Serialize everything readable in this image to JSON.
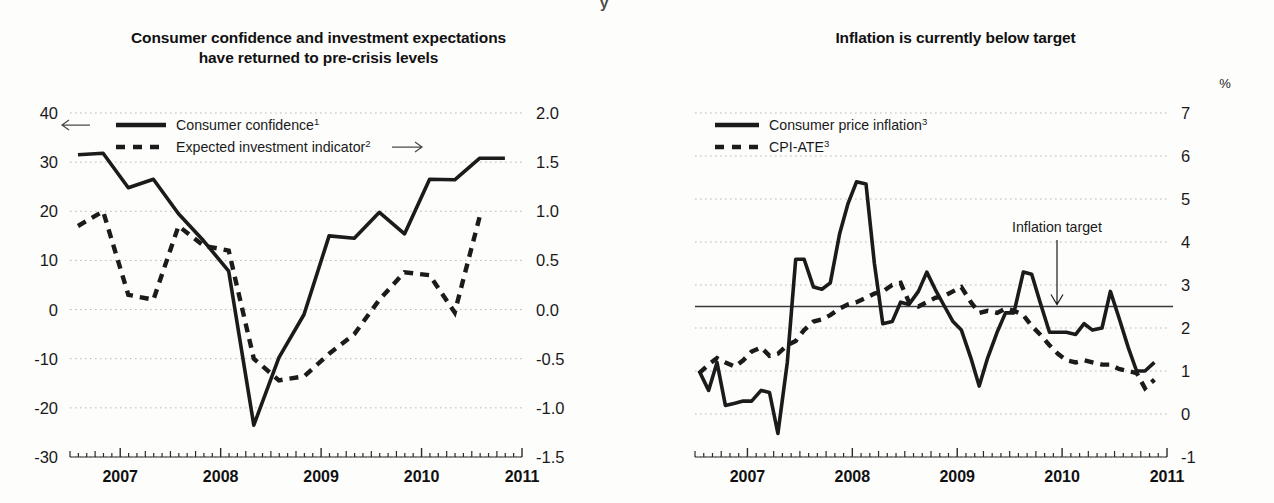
{
  "page": {
    "background": "#fdfdfc",
    "ink": "#1b1b1b",
    "grid_color": "#b9b9b9",
    "clipped_header_fragment": "y"
  },
  "left_panel": {
    "title": "Consumer confidence and investment expectations\nhave returned to pre-crisis levels",
    "legend": [
      {
        "label": "Consumer confidence",
        "superscript": "1",
        "style": "solid",
        "arrow": "left",
        "axis": "left"
      },
      {
        "label": "Expected investment indicator",
        "superscript": "2",
        "style": "dashed",
        "arrow": "right",
        "axis": "right"
      }
    ],
    "left_axis_ticks": [
      "40",
      "30",
      "20",
      "10",
      "0",
      "-10",
      "-20",
      "-30"
    ],
    "right_axis_ticks": [
      "2.0",
      "1.5",
      "1.0",
      "0.5",
      "0.0",
      "-0.5",
      "-1.0",
      "-1.5"
    ],
    "x_axis_labels": [
      "2007",
      "2008",
      "2009",
      "2010",
      "2011"
    ]
  },
  "right_panel": {
    "title": "Inflation is currently below target",
    "unit": "%",
    "legend": [
      {
        "label": "Consumer price inflation",
        "superscript": "3",
        "style": "solid"
      },
      {
        "label": "CPI-ATE",
        "superscript": "3",
        "style": "dashed"
      }
    ],
    "annotation": {
      "text": "Inflation target",
      "value": 2.5
    },
    "axis_ticks": [
      "7",
      "6",
      "5",
      "4",
      "3",
      "2",
      "1",
      "0",
      "-1"
    ],
    "x_axis_labels": [
      "2007",
      "2008",
      "2009",
      "2010",
      "2011"
    ]
  },
  "chart_data": [
    {
      "id": "consumer-confidence-chart",
      "type": "line",
      "title": "Consumer confidence and investment expectations have returned to pre-crisis levels",
      "xlabel": "",
      "ylabel": "",
      "grid": true,
      "legend_position": "top-left",
      "xlim": [
        2006.5,
        2011.0
      ],
      "x_tick_labels": [
        "2007",
        "2008",
        "2009",
        "2010",
        "2011"
      ],
      "x_tick_label_positions": [
        2007.0,
        2008.0,
        2009.0,
        2010.0,
        2011.0
      ],
      "ylim_left": [
        -30,
        40
      ],
      "ylim_right": [
        -1.5,
        2.0
      ],
      "y_left_ticks": [
        40,
        30,
        20,
        10,
        0,
        -10,
        -20,
        -30
      ],
      "y_right_ticks": [
        2.0,
        1.5,
        1.0,
        0.5,
        0.0,
        -0.5,
        -1.0,
        -1.5
      ],
      "series": [
        {
          "name": "Consumer confidence",
          "superscript": "1",
          "style": "solid",
          "axis": "left",
          "arrow": "left",
          "x": [
            2006.58,
            2006.83,
            2007.08,
            2007.33,
            2007.58,
            2007.83,
            2008.08,
            2008.33,
            2008.58,
            2008.83,
            2009.08,
            2009.33,
            2009.58,
            2009.83,
            2010.08,
            2010.33,
            2010.58,
            2010.83
          ],
          "values": [
            31.5,
            31.8,
            24.8,
            26.5,
            19.5,
            14.0,
            7.8,
            -23.5,
            -9.8,
            -1.0,
            15.0,
            14.5,
            19.8,
            15.4,
            26.5,
            26.4,
            30.8,
            30.8
          ]
        },
        {
          "name": "Expected investment indicator",
          "superscript": "2",
          "style": "dashed",
          "axis": "right",
          "arrow": "right",
          "x": [
            2006.58,
            2006.83,
            2007.08,
            2007.33,
            2007.58,
            2007.83,
            2008.08,
            2008.33,
            2008.58,
            2008.83,
            2009.08,
            2009.33,
            2009.58,
            2009.83,
            2010.08,
            2010.33,
            2010.58
          ],
          "values": [
            0.85,
            1.0,
            0.15,
            0.1,
            0.85,
            0.65,
            0.6,
            -0.5,
            -0.72,
            -0.68,
            -0.45,
            -0.25,
            0.1,
            0.38,
            0.35,
            -0.03,
            0.95
          ]
        }
      ]
    },
    {
      "id": "inflation-chart",
      "type": "line",
      "title": "Inflation is currently below target",
      "xlabel": "",
      "ylabel": "%",
      "grid": true,
      "legend_position": "top-left",
      "xlim": [
        2006.5,
        2011.0
      ],
      "x_tick_labels": [
        "2007",
        "2008",
        "2009",
        "2010",
        "2011"
      ],
      "x_tick_label_positions": [
        2007.0,
        2008.0,
        2009.0,
        2010.0,
        2011.0
      ],
      "ylim": [
        -1,
        7
      ],
      "y_ticks": [
        7,
        6,
        5,
        4,
        3,
        2,
        1,
        0,
        -1
      ],
      "reference_line": {
        "label": "Inflation target",
        "value": 2.5
      },
      "series": [
        {
          "name": "Consumer price inflation",
          "superscript": "3",
          "style": "solid",
          "x": [
            2006.54,
            2006.63,
            2006.71,
            2006.79,
            2006.88,
            2006.96,
            2007.04,
            2007.13,
            2007.21,
            2007.29,
            2007.38,
            2007.46,
            2007.54,
            2007.63,
            2007.71,
            2007.79,
            2007.88,
            2007.96,
            2008.04,
            2008.13,
            2008.21,
            2008.29,
            2008.38,
            2008.46,
            2008.54,
            2008.63,
            2008.71,
            2008.79,
            2008.88,
            2008.96,
            2009.04,
            2009.13,
            2009.21,
            2009.29,
            2009.38,
            2009.46,
            2009.54,
            2009.63,
            2009.71,
            2009.79,
            2009.88,
            2009.96,
            2010.04,
            2010.13,
            2010.21,
            2010.29,
            2010.38,
            2010.46,
            2010.54,
            2010.63,
            2010.71,
            2010.79,
            2010.88
          ],
          "values": [
            1.0,
            0.55,
            1.2,
            0.2,
            0.25,
            0.3,
            0.3,
            0.55,
            0.5,
            -0.45,
            1.2,
            3.6,
            3.6,
            2.95,
            2.9,
            3.05,
            4.2,
            4.9,
            5.4,
            5.35,
            3.5,
            2.1,
            2.15,
            2.6,
            2.55,
            2.85,
            3.3,
            2.9,
            2.5,
            2.15,
            1.95,
            1.3,
            0.65,
            1.3,
            1.9,
            2.35,
            2.35,
            3.3,
            3.25,
            2.6,
            1.9,
            1.9,
            1.9,
            1.85,
            2.1,
            1.95,
            2.0,
            2.85,
            2.25,
            1.55,
            1.0,
            1.0,
            1.2
          ]
        },
        {
          "name": "CPI-ATE",
          "superscript": "3",
          "style": "dashed",
          "x": [
            2006.54,
            2006.63,
            2006.71,
            2006.79,
            2006.88,
            2006.96,
            2007.04,
            2007.13,
            2007.21,
            2007.29,
            2007.38,
            2007.46,
            2007.54,
            2007.63,
            2007.71,
            2007.79,
            2007.88,
            2007.96,
            2008.04,
            2008.13,
            2008.21,
            2008.29,
            2008.38,
            2008.46,
            2008.54,
            2008.63,
            2008.71,
            2008.79,
            2008.88,
            2008.96,
            2009.04,
            2009.13,
            2009.21,
            2009.29,
            2009.38,
            2009.46,
            2009.54,
            2009.63,
            2009.71,
            2009.79,
            2009.88,
            2009.96,
            2010.04,
            2010.13,
            2010.21,
            2010.29,
            2010.38,
            2010.46,
            2010.54,
            2010.63,
            2010.71,
            2010.79,
            2010.88
          ],
          "values": [
            0.95,
            1.15,
            1.3,
            1.2,
            1.1,
            1.25,
            1.45,
            1.55,
            1.35,
            1.4,
            1.6,
            1.7,
            1.95,
            2.15,
            2.2,
            2.3,
            2.45,
            2.55,
            2.6,
            2.7,
            2.8,
            2.85,
            3.0,
            3.05,
            2.6,
            2.5,
            2.6,
            2.7,
            2.75,
            2.85,
            2.95,
            2.6,
            2.35,
            2.4,
            2.35,
            2.45,
            2.4,
            2.3,
            2.05,
            1.85,
            1.6,
            1.4,
            1.25,
            1.2,
            1.25,
            1.2,
            1.15,
            1.15,
            1.05,
            1.0,
            0.95,
            0.6,
            0.8
          ]
        }
      ]
    }
  ]
}
